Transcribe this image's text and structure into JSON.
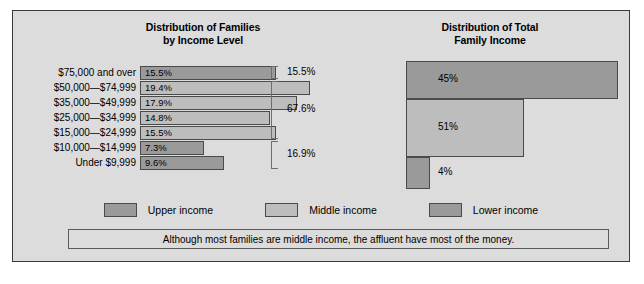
{
  "figure": {
    "background_color": "#dcdcdc",
    "border_color": "#3a3a3a"
  },
  "colors": {
    "upper_income": "#9a9a9a",
    "middle_income": "#bdbdbd",
    "lower_income": "#9a9a9a",
    "bar_outline": "#4a4a4a",
    "bracket": "#6e6e6e"
  },
  "left_chart": {
    "title_line1": "Distribution of Families",
    "title_line2": "by Income Level",
    "rows": [
      {
        "label": "$75,000 and over",
        "value_label": "15.5%",
        "value": 15.5,
        "group": "upper"
      },
      {
        "label": "$50,000—$74,999",
        "value_label": "19.4%",
        "value": 19.4,
        "group": "middle"
      },
      {
        "label": "$35,000—$49,999",
        "value_label": "17.9%",
        "value": 17.9,
        "group": "middle"
      },
      {
        "label": "$25,000—$34,999",
        "value_label": "14.8%",
        "value": 14.8,
        "group": "middle"
      },
      {
        "label": "$15,000—$24,999",
        "value_label": "15.5%",
        "value": 15.5,
        "group": "middle"
      },
      {
        "label": "$10,000—$14,999",
        "value_label": "7.3%",
        "value": 7.3,
        "group": "lower"
      },
      {
        "label": "Under $9,999",
        "value_label": "9.6%",
        "value": 9.6,
        "group": "lower"
      }
    ],
    "brackets": [
      {
        "label": "15.5%",
        "value": 15.5,
        "rows": 1
      },
      {
        "label": "67.6%",
        "value": 67.6,
        "rows": 4
      },
      {
        "label": "16.9%",
        "value": 16.9,
        "rows": 2
      }
    ]
  },
  "right_chart": {
    "title_line1": "Distribution of Total",
    "title_line2": "Family Income",
    "bars": [
      {
        "value_label": "45%",
        "value": 45,
        "group": "upper"
      },
      {
        "value_label": "51%",
        "value": 51,
        "group": "middle"
      },
      {
        "value_label": "4%",
        "value": 4,
        "group": "lower"
      }
    ]
  },
  "legend": {
    "items": [
      {
        "label": "Upper income",
        "group": "upper"
      },
      {
        "label": "Middle income",
        "group": "middle"
      },
      {
        "label": "Lower income",
        "group": "lower"
      }
    ]
  },
  "caption": {
    "text": "Although most families are middle income, the affluent have most of the money."
  },
  "chart_data": {
    "type": "bar",
    "charts": [
      {
        "type": "bar",
        "orientation": "horizontal",
        "title": "Distribution of Families by Income Level",
        "xlabel": "",
        "ylabel": "",
        "grid": false,
        "legend_position": "bottom-center",
        "categories": [
          "$75,000 and over",
          "$50,000—$74,999",
          "$35,000—$49,999",
          "$25,000—$34,999",
          "$15,000—$24,999",
          "$10,000—$14,999",
          "Under $9,999"
        ],
        "values": [
          15.5,
          19.4,
          17.9,
          14.8,
          15.5,
          7.3,
          9.6
        ],
        "value_labels": [
          "15.5%",
          "19.4%",
          "17.9%",
          "14.8%",
          "15.5%",
          "7.3%",
          "9.6%"
        ],
        "series_groups": [
          "Upper income",
          "Middle income",
          "Middle income",
          "Middle income",
          "Middle income",
          "Lower income",
          "Lower income"
        ],
        "xlim": [
          0,
          20
        ],
        "annotations": [
          {
            "label": "15.5%",
            "spans_categories": [
              "$75,000 and over"
            ]
          },
          {
            "label": "67.6%",
            "spans_categories": [
              "$50,000—$74,999",
              "$35,000—$49,999",
              "$25,000—$34,999",
              "$15,000—$24,999"
            ]
          },
          {
            "label": "16.9%",
            "spans_categories": [
              "$10,000—$14,999",
              "Under $9,999"
            ]
          }
        ]
      },
      {
        "type": "bar",
        "orientation": "horizontal",
        "title": "Distribution of Total Family Income",
        "xlabel": "",
        "ylabel": "",
        "grid": false,
        "categories": [
          "Upper income",
          "Middle income",
          "Lower income"
        ],
        "values": [
          45,
          51,
          4
        ],
        "value_labels": [
          "45%",
          "51%",
          "4%"
        ],
        "xlim": [
          0,
          100
        ]
      }
    ],
    "legend_entries": [
      "Upper income",
      "Middle income",
      "Lower income"
    ],
    "caption": "Although most families are middle income, the affluent have most of the money."
  }
}
